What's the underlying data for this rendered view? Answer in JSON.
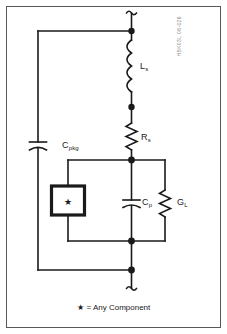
{
  "figure": {
    "doc_code": "HBK03L 06-026",
    "caption_symbol": "★",
    "caption_text": " = Any Component",
    "border_color": "#58585a",
    "wire_color": "#1a1a1a",
    "background": "#ffffff"
  },
  "components": {
    "inductor": {
      "label_main": "L",
      "label_sub": "s",
      "name": "series-inductance"
    },
    "resistor": {
      "label_main": "R",
      "label_sub": "s",
      "name": "series-resistance"
    },
    "capacitor_pkg": {
      "label_main": "C",
      "label_sub": "pkg",
      "name": "package-capacitance"
    },
    "capacitor_p": {
      "label_main": "C",
      "label_sub": "p",
      "name": "parallel-capacitance"
    },
    "conductance": {
      "label_main": "G",
      "label_sub": "L",
      "name": "load-conductance"
    },
    "any_component_box": {
      "symbol": "★",
      "name": "any-component-box"
    }
  },
  "terminals": {
    "top_break": "break-symbol",
    "bottom_break": "break-symbol"
  }
}
